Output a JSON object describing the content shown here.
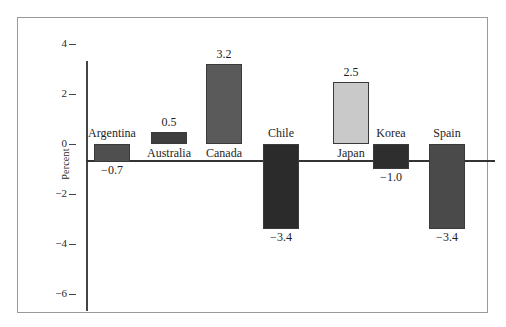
{
  "figure": {
    "background_color": "#ffffff",
    "frame_color": "#9a9a9a",
    "axis_color": "#333333"
  },
  "chart_data": {
    "type": "bar",
    "title": "",
    "subtitle": "",
    "xlabel": "",
    "ylabel": "Percent",
    "categories": [
      "Argentina",
      "Australia",
      "Canada",
      "Chile",
      "Japan",
      "Korea",
      "Spain"
    ],
    "values": [
      -0.7,
      0.5,
      3.2,
      -3.4,
      2.5,
      -1.0,
      -3.4
    ],
    "value_labels": [
      "−0.7",
      "0.5",
      "3.2",
      "−3.4",
      "2.5",
      "−1.0",
      "−3.4"
    ],
    "bar_colors": [
      "#4f4f4f",
      "#3e3e3e",
      "#5a5a5a",
      "#2b2b2b",
      "#c9c9c9",
      "#2e2e2e",
      "#4a4a4a"
    ],
    "ylim": [
      -6,
      4
    ],
    "yticks": [
      4,
      2,
      0,
      -2,
      -4,
      -6
    ],
    "ytick_labels": [
      "4",
      "2",
      "0",
      "−2",
      "−4",
      "−6"
    ],
    "grid": false,
    "legend": "none",
    "bar_edge_color": "#3a3a3a"
  }
}
